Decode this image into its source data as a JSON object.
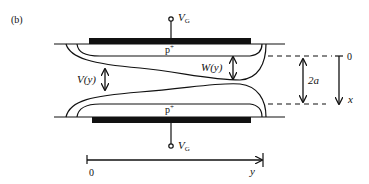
{
  "figure": {
    "panel_label": "(b)"
  },
  "labels": {
    "gate_top": "V",
    "gate_top_sub": "G",
    "gate_bottom": "V",
    "gate_bottom_sub": "G",
    "p_plus_top": "p",
    "p_plus_top_sup": "+",
    "p_plus_bottom": "p",
    "p_plus_bottom_sup": "+",
    "channel_width": "V(y)",
    "depletion_width": "W(y)",
    "half_width": "2a",
    "x_origin": "0",
    "x_axis": "x",
    "y_origin": "0",
    "y_axis": "y"
  },
  "colors": {
    "ink": "#111111",
    "background": "#ffffff"
  }
}
